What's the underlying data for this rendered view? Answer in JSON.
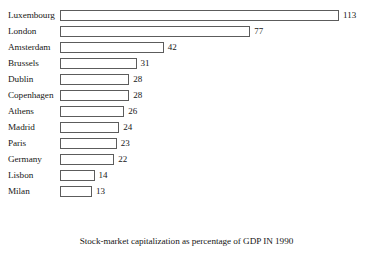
{
  "chart_data": {
    "type": "bar",
    "orientation": "horizontal",
    "title": "",
    "caption": "Stock-market capitalization as percentage of GDP IN 1990",
    "xlabel": "",
    "ylabel": "",
    "xlim": [
      0,
      113
    ],
    "grid": false,
    "legend": null,
    "value_labels": true,
    "categories": [
      "Luxembourg",
      "London",
      "Amsterdam",
      "Brussels",
      "Dublin",
      "Copenhagen",
      "Athens",
      "Madrid",
      "Paris",
      "Germany",
      "Lisbon",
      "Milan"
    ],
    "values": [
      113,
      77,
      42,
      31,
      28,
      28,
      26,
      24,
      23,
      22,
      14,
      13
    ],
    "bars": [
      {
        "label": "Luxembourg",
        "value": 113,
        "value_text": "113"
      },
      {
        "label": "London",
        "value": 77,
        "value_text": "77"
      },
      {
        "label": "Amsterdam",
        "value": 42,
        "value_text": "42"
      },
      {
        "label": "Brussels",
        "value": 31,
        "value_text": "31"
      },
      {
        "label": "Dublin",
        "value": 28,
        "value_text": "28"
      },
      {
        "label": "Copenhagen",
        "value": 28,
        "value_text": "28"
      },
      {
        "label": "Athens",
        "value": 26,
        "value_text": "26"
      },
      {
        "label": "Madrid",
        "value": 24,
        "value_text": "24"
      },
      {
        "label": "Paris",
        "value": 23,
        "value_text": "23"
      },
      {
        "label": "Germany",
        "value": 22,
        "value_text": "22"
      },
      {
        "label": "Lisbon",
        "value": 14,
        "value_text": "14"
      },
      {
        "label": "Milan",
        "value": 13,
        "value_text": "13"
      }
    ],
    "colors": {
      "bar_fill": "#ffffff",
      "bar_border": "#5c5c5c",
      "text": "#171717",
      "background": "#ffffff"
    },
    "px_per_unit": 2.47
  }
}
